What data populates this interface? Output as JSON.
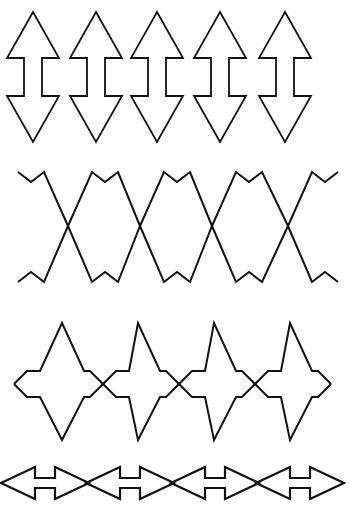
{
  "figure": {
    "title": "Decorative line-art border pattern sheet",
    "background_color": "#ffffff",
    "stroke_color": "#111111",
    "width": 352,
    "height": 507,
    "band_count": 4
  },
  "bands": [
    {
      "id": "band-1",
      "name": "vertical-double-arrow-row",
      "description": "Row of five interlocking vertical double-headed arrows",
      "motif": "double-headed-arrow-vertical",
      "repeat_count": 5,
      "period": 63,
      "first_center_x": 33,
      "top_y": 12,
      "bottom_y": 142,
      "head_half_width": 26,
      "shaft_half_width": 9,
      "head_base_top_y": 58,
      "head_base_bottom_y": 98,
      "stroke_width": 1.8
    },
    {
      "id": "band-2",
      "name": "crossing-zigzag-row",
      "description": "Two mirrored zigzag ribbons crossing in X shapes with small serrations along the top and bottom edges",
      "motif": "crossing-zigzag",
      "crossing_count": 4,
      "crossing_x_positions": [
        68,
        140,
        212,
        288
      ],
      "period": 72,
      "top_y": 170,
      "bottom_y": 282,
      "serration_amplitude": 10,
      "serration_step": 13,
      "stroke_width": 2.0
    },
    {
      "id": "band-3",
      "name": "spiked-zigzag-row",
      "description": "Zigzag band with tall narrow spikes reaching above and below a small diamond-notched center chain",
      "motif": "spiked-zigzag",
      "spike_count": 4,
      "spike_x_positions": [
        62,
        138,
        214,
        290
      ],
      "period": 76,
      "spike_top_y": 323,
      "spike_bottom_y": 440,
      "center_y": 384,
      "diamond_amplitude": 13,
      "stroke_width": 2.0
    },
    {
      "id": "band-4",
      "name": "horizontal-double-arrow-row",
      "description": "Chain of flattened horizontal double-headed arrows meeting tip to tip",
      "motif": "double-headed-arrow-horizontal",
      "repeat_count": 4,
      "period": 85,
      "first_center_x": 45,
      "center_y": 483,
      "head_half_height": 16,
      "shaft_half_height": 5,
      "stroke_width": 2.2
    }
  ],
  "chart_data": {
    "type": "line",
    "title": "Decorative line-art border pattern sheet",
    "xlabel": "",
    "ylabel": "",
    "xlim": [
      0,
      352
    ],
    "ylim": [
      507,
      0
    ],
    "grid": false,
    "legend": "none",
    "series": [
      {
        "name": "band-1-vertical-double-arrows",
        "kind": "closed-polygons",
        "repeat_count": 5,
        "period": 63,
        "polygon_offsets": [
          [
            0,
            -65
          ],
          [
            26,
            -19
          ],
          [
            9,
            -19
          ],
          [
            9,
            19
          ],
          [
            26,
            19
          ],
          [
            0,
            65
          ],
          [
            -26,
            19
          ],
          [
            -9,
            19
          ],
          [
            -9,
            -19
          ],
          [
            -26,
            -19
          ]
        ],
        "centers": [
          [
            33,
            77
          ],
          [
            96,
            77
          ],
          [
            157,
            77
          ],
          [
            220,
            77
          ],
          [
            285,
            77
          ]
        ]
      },
      {
        "name": "band-2-zigzag-descending",
        "kind": "polyline",
        "points": [
          [
            18,
            172
          ],
          [
            31,
            182
          ],
          [
            44,
            172
          ],
          [
            68,
            226
          ],
          [
            92,
            282
          ],
          [
            105,
            272
          ],
          [
            118,
            282
          ],
          [
            140,
            226
          ],
          [
            164,
            172
          ],
          [
            177,
            182
          ],
          [
            190,
            172
          ],
          [
            212,
            226
          ],
          [
            236,
            282
          ],
          [
            249,
            272
          ],
          [
            262,
            282
          ],
          [
            288,
            226
          ],
          [
            312,
            172
          ],
          [
            325,
            182
          ],
          [
            338,
            172
          ]
        ]
      },
      {
        "name": "band-2-zigzag-ascending",
        "kind": "polyline",
        "points": [
          [
            18,
            282
          ],
          [
            31,
            272
          ],
          [
            44,
            282
          ],
          [
            68,
            226
          ],
          [
            92,
            172
          ],
          [
            105,
            182
          ],
          [
            118,
            172
          ],
          [
            140,
            226
          ],
          [
            164,
            282
          ],
          [
            177,
            272
          ],
          [
            190,
            282
          ],
          [
            212,
            226
          ],
          [
            236,
            172
          ],
          [
            249,
            182
          ],
          [
            262,
            172
          ],
          [
            288,
            226
          ],
          [
            312,
            282
          ],
          [
            325,
            272
          ],
          [
            338,
            282
          ]
        ]
      },
      {
        "name": "band-3-spike-upper",
        "kind": "polyline",
        "points": [
          [
            14,
            384
          ],
          [
            27,
            371
          ],
          [
            40,
            371
          ],
          [
            62,
            323
          ],
          [
            84,
            371
          ],
          [
            90,
            371
          ],
          [
            103,
            384
          ],
          [
            116,
            371
          ],
          [
            129,
            371
          ],
          [
            138,
            323
          ],
          [
            160,
            371
          ],
          [
            166,
            371
          ],
          [
            179,
            384
          ],
          [
            192,
            371
          ],
          [
            205,
            371
          ],
          [
            214,
            323
          ],
          [
            236,
            371
          ],
          [
            242,
            371
          ],
          [
            255,
            384
          ],
          [
            268,
            371
          ],
          [
            281,
            371
          ],
          [
            290,
            323
          ],
          [
            312,
            371
          ],
          [
            318,
            371
          ],
          [
            331,
            384
          ]
        ]
      },
      {
        "name": "band-3-spike-lower",
        "kind": "polyline",
        "points": [
          [
            14,
            384
          ],
          [
            27,
            397
          ],
          [
            40,
            397
          ],
          [
            62,
            440
          ],
          [
            84,
            397
          ],
          [
            90,
            397
          ],
          [
            103,
            384
          ],
          [
            116,
            397
          ],
          [
            129,
            397
          ],
          [
            138,
            440
          ],
          [
            160,
            397
          ],
          [
            166,
            397
          ],
          [
            179,
            384
          ],
          [
            192,
            397
          ],
          [
            205,
            397
          ],
          [
            214,
            440
          ],
          [
            236,
            397
          ],
          [
            242,
            397
          ],
          [
            255,
            384
          ],
          [
            268,
            397
          ],
          [
            281,
            397
          ],
          [
            290,
            440
          ],
          [
            312,
            397
          ],
          [
            318,
            397
          ],
          [
            331,
            384
          ]
        ]
      },
      {
        "name": "band-4-horizontal-double-arrows",
        "kind": "closed-polygons",
        "repeat_count": 4,
        "period": 85,
        "polygon_offsets": [
          [
            -44,
            0
          ],
          [
            -10,
            -16
          ],
          [
            -10,
            -5
          ],
          [
            10,
            -5
          ],
          [
            10,
            -16
          ],
          [
            44,
            0
          ],
          [
            10,
            16
          ],
          [
            10,
            5
          ],
          [
            -10,
            5
          ],
          [
            -10,
            16
          ]
        ],
        "centers": [
          [
            45,
            483
          ],
          [
            130,
            483
          ],
          [
            215,
            483
          ],
          [
            300,
            483
          ]
        ]
      }
    ]
  }
}
